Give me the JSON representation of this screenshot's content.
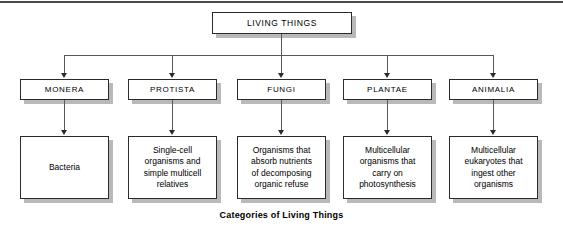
{
  "figure": {
    "caption": "Categories of Living Things",
    "root": {
      "label": "LIVING THINGS"
    },
    "kingdoms": [
      {
        "name": "MONERA",
        "description_lines": [
          "Bacteria"
        ]
      },
      {
        "name": "PROTISTA",
        "description_lines": [
          "Single-cell",
          "organisms and",
          "simple multicell",
          "relatives"
        ]
      },
      {
        "name": "FUNGI",
        "description_lines": [
          "Organisms that",
          "absorb nutrients",
          "of decomposing",
          "organic refuse"
        ]
      },
      {
        "name": "PLANTAE",
        "description_lines": [
          "Multicellular",
          "organisms that",
          "carry on",
          "photosynthesis"
        ]
      },
      {
        "name": "ANIMALIA",
        "description_lines": [
          "Multicellular",
          "eukaryotes that",
          "ingest other",
          "organisms"
        ]
      }
    ]
  },
  "colors": {
    "box_border": "#2b2b2b",
    "box_shadow": "#b9b9b9",
    "connector": "#585858",
    "text": "#000000",
    "background": "#ffffff",
    "top_rule": "#4a4a4a"
  }
}
